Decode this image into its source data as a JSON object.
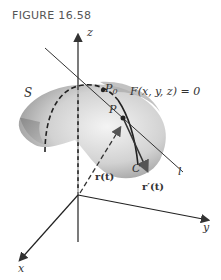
{
  "figure": {
    "caption": "FIGURE 16.58",
    "axes": {
      "z": "z",
      "y": "y",
      "x": "x"
    },
    "surface_label": "S",
    "equation": "F(x, y, z) = 0",
    "points": {
      "p0": "P",
      "p0_sub": "0",
      "p": "P"
    },
    "curve_label": "C",
    "line_label": "l",
    "position_vector": "r(t)",
    "tangent_vector": "r′(t)"
  }
}
